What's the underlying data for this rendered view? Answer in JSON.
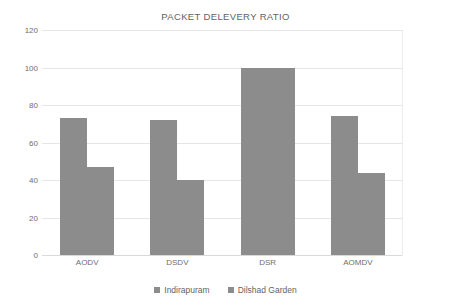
{
  "chart_data": {
    "type": "bar",
    "title": "PACKET DELEVERY RATIO",
    "xlabel": "",
    "ylabel": "",
    "categories": [
      "AODV",
      "DSDV",
      "DSR",
      "AOMDV"
    ],
    "series": [
      {
        "name": "Indirapuram",
        "values": [
          73,
          72,
          100,
          74
        ],
        "color": "#8c8c8c"
      },
      {
        "name": "Dilshad Garden",
        "values": [
          47,
          40,
          100,
          44
        ],
        "color": "#8c8c8c"
      }
    ],
    "ylim": [
      0,
      120
    ],
    "yticks": [
      0,
      20,
      40,
      60,
      80,
      100,
      120
    ],
    "ytick_labels": [
      "0",
      "20",
      "40",
      "60",
      "80",
      "100",
      "120"
    ],
    "grid": true,
    "grid_color": "#e6e6e6",
    "legend_position": "bottom",
    "background": "#ffffff"
  },
  "legend": {
    "items": [
      {
        "label": "Indirapuram",
        "marker": "square-marker-icon"
      },
      {
        "label": "Dilshad Garden",
        "marker": "square-marker-icon"
      }
    ]
  }
}
